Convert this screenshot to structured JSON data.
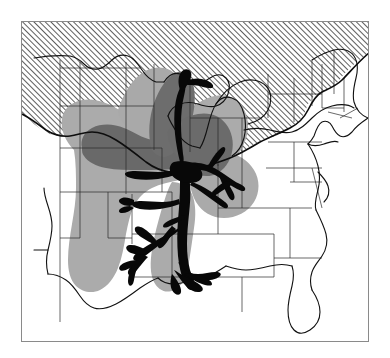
{
  "figure": {
    "type": "thematic-map",
    "region": "Central and Eastern United States",
    "frame": {
      "x": 21,
      "y": 21,
      "width": 348,
      "height": 321,
      "border_color": "#8a8a8a",
      "background_color": "#ffffff"
    },
    "canvas": {
      "width": 390,
      "height": 358,
      "background_color": "#ffffff"
    }
  },
  "map_layers": [
    {
      "name": "hatched-glaciated-region",
      "label": "Hatched northern zone",
      "pattern": "diagonal-hatch",
      "hatch_angle_deg": -45,
      "hatch_spacing_px": 4,
      "stroke_color": "#1a1a1a",
      "fill_color": "#ffffff",
      "coverage": "Northern tier: Dakotas, Minnesota, Wisconsin, Michigan, northern Illinois, Indiana, Ohio, Pennsylvania, New York and New England"
    },
    {
      "name": "light-gray-extent-zone",
      "label": "Light gray shaded extent",
      "fill_color": "#ababab",
      "coverage": "Great Plains through central Mississippi valley, with lobes north into Minnesota, east into Kentucky and Tennessee, and south along the lower Mississippi"
    },
    {
      "name": "dark-gray-core-zone",
      "label": "Dark gray core zone",
      "fill_color": "#696969",
      "coverage": "Nebraska, Iowa, northern Missouri, Illinois and an arm reaching north-east along the upper Mississippi"
    },
    {
      "name": "mississippi-river-floodplain",
      "label": "Mississippi River system and floodplain",
      "fill_color": "#080808",
      "coverage": "Main trunk from the Ohio confluence to the Gulf delta, plus Ohio, Missouri, Arkansas, Red and Tennessee river branches"
    },
    {
      "name": "state-boundaries",
      "label": "State boundary lines",
      "stroke_color": "#2a2a2a",
      "stroke_width": 0.7
    },
    {
      "name": "national-coastline",
      "label": "National border and coastline",
      "stroke_color": "#111111",
      "stroke_width": 1.1
    },
    {
      "name": "glacial-boundary-line",
      "label": "Southern limit of hatched zone",
      "stroke_color": "#0d0d0d",
      "stroke_width": 1.6
    }
  ],
  "colors": {
    "page_background": "#ffffff",
    "frame_border": "#8a8a8a",
    "hatch_stroke": "#1a1a1a",
    "light_gray": "#ababab",
    "dark_gray": "#696969",
    "river_black": "#080808",
    "state_line": "#2a2a2a",
    "coast_line": "#111111"
  },
  "labels": {
    "title": "",
    "subtitle": "",
    "legend_entries": [],
    "annotations": []
  }
}
